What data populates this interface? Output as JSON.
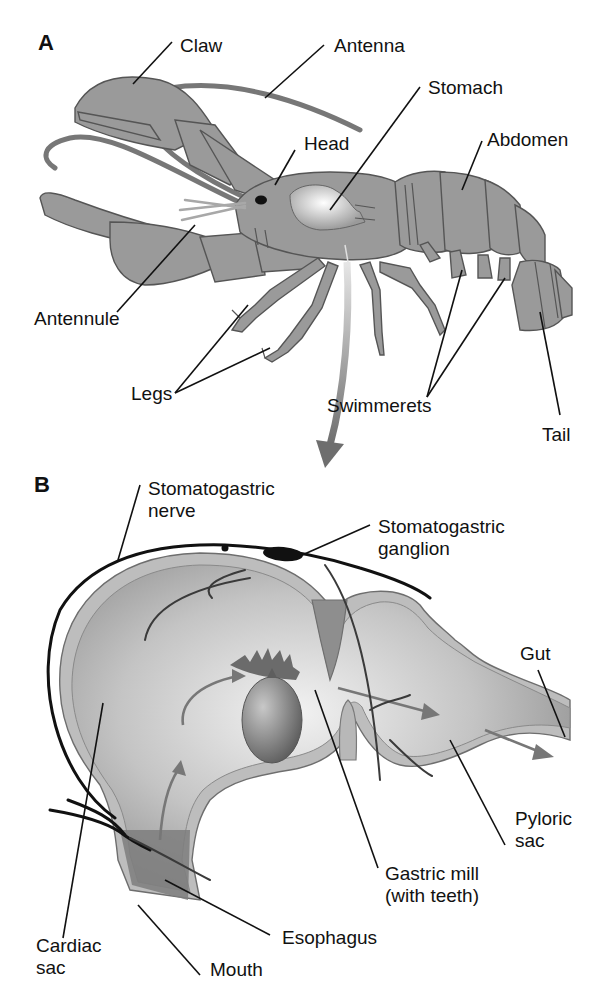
{
  "figure": {
    "panels": [
      {
        "id": "A",
        "label": "A",
        "subject": "lobster external anatomy",
        "labels": {
          "claw": "Claw",
          "antenna": "Antenna",
          "stomach": "Stomach",
          "head": "Head",
          "abdomen": "Abdomen",
          "antennule": "Antennule",
          "legs": "Legs",
          "swimmerets": "Swimmerets",
          "tail": "Tail"
        }
      },
      {
        "id": "B",
        "label": "B",
        "subject": "stomach cross-section",
        "labels": {
          "stomatogastric_nerve_1": "Stomatogastric",
          "stomatogastric_nerve_2": "nerve",
          "stomatogastric_ganglion_1": "Stomatogastric",
          "stomatogastric_ganglion_2": "ganglion",
          "gut": "Gut",
          "pyloric_sac_1": "Pyloric",
          "pyloric_sac_2": "sac",
          "gastric_mill_1": "Gastric mill",
          "gastric_mill_2": "(with teeth)",
          "esophagus": "Esophagus",
          "cardiac_sac_1": "Cardiac",
          "cardiac_sac_2": "sac",
          "mouth": "Mouth"
        }
      }
    ],
    "colors": {
      "body_fill": "#9a9a9a",
      "outline": "#555555",
      "stomach_wall": "#bdbdbd",
      "nerve": "#111111",
      "text": "#111111",
      "background": "#ffffff"
    }
  }
}
